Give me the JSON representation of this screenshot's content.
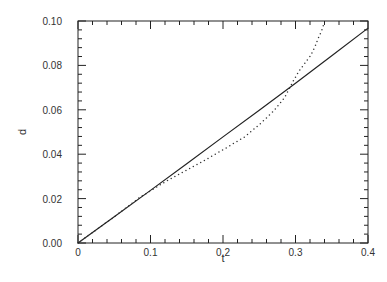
{
  "chart_data": {
    "type": "line",
    "title": "",
    "xlabel": "t",
    "ylabel": "d",
    "xlim": [
      0,
      0.4
    ],
    "ylim": [
      0,
      0.1
    ],
    "xticks": [
      0,
      0.1,
      0.2,
      0.3,
      0.4
    ],
    "xtick_labels": [
      "0",
      "0.1",
      "0.2",
      "0.3",
      "0.4"
    ],
    "yticks": [
      0,
      0.02,
      0.04,
      0.06,
      0.08,
      0.1
    ],
    "ytick_labels": [
      "0.00",
      "0.02",
      "0.04",
      "0.06",
      "0.08",
      "0.10"
    ],
    "x_minor_per_major": 4,
    "y_minor_per_major": 4,
    "grid": false,
    "legend": null,
    "series": [
      {
        "name": "solid",
        "style": "solid",
        "color": "#222222",
        "x": [
          0,
          0.05,
          0.1,
          0.15,
          0.2,
          0.25,
          0.3,
          0.35,
          0.4
        ],
        "y": [
          0,
          0.0118,
          0.0237,
          0.0357,
          0.0478,
          0.0598,
          0.072,
          0.0843,
          0.0968
        ]
      },
      {
        "name": "dotted",
        "style": "dotted",
        "color": "#333333",
        "x": [
          0,
          0.05,
          0.085,
          0.12,
          0.168,
          0.2,
          0.23,
          0.251,
          0.27,
          0.285,
          0.297,
          0.305,
          0.313,
          0.321,
          0.327,
          0.331,
          0.336,
          0.34
        ],
        "y": [
          0,
          0.0118,
          0.0205,
          0.0275,
          0.036,
          0.042,
          0.0478,
          0.0536,
          0.0595,
          0.0655,
          0.073,
          0.0775,
          0.081,
          0.0845,
          0.0885,
          0.092,
          0.0955,
          0.0995
        ]
      }
    ]
  }
}
